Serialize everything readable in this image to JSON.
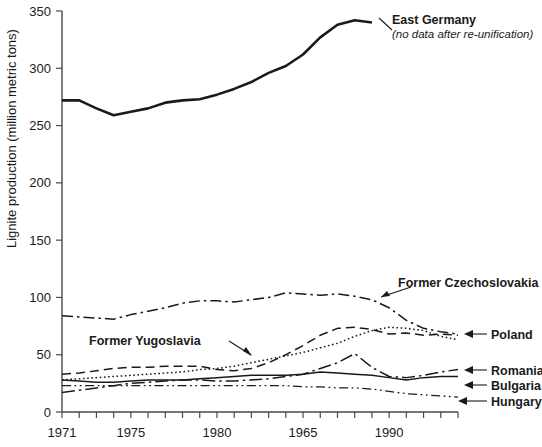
{
  "chart_data": {
    "type": "line",
    "title": "",
    "xlabel": "",
    "ylabel": "Lignite production (million metric tons)",
    "xlim": [
      1971,
      1994
    ],
    "ylim": [
      0,
      350
    ],
    "grid": false,
    "legend_position": "inline-annotations",
    "y_ticks": [
      0,
      50,
      100,
      150,
      200,
      250,
      300,
      350
    ],
    "y_tick_labels": [
      "0",
      "50",
      "100",
      "150",
      "200",
      "250",
      "300",
      "350"
    ],
    "x_tick_values": [
      1971,
      1972,
      1973,
      1974,
      1975,
      1976,
      1977,
      1978,
      1979,
      1980,
      1981,
      1982,
      1983,
      1984,
      1985,
      1986,
      1987,
      1988,
      1989,
      1990,
      1991,
      1992,
      1993,
      1994
    ],
    "x_tick_labels": [
      {
        "value": 1971,
        "label": "1971"
      },
      {
        "value": 1975,
        "label": "1975"
      },
      {
        "value": 1980,
        "label": "1980"
      },
      {
        "value": 1985,
        "label": "1965"
      },
      {
        "value": 1990,
        "label": "1990"
      }
    ],
    "series": [
      {
        "name": "East Germany",
        "style": "solid",
        "note": "(no data after re-unification)",
        "x": [
          1971,
          1972,
          1973,
          1974,
          1975,
          1976,
          1977,
          1978,
          1979,
          1980,
          1981,
          1982,
          1983,
          1984,
          1985,
          1986,
          1987,
          1988,
          1989
        ],
        "values": [
          272,
          272,
          265,
          259,
          262,
          265,
          270,
          272,
          273,
          277,
          282,
          288,
          296,
          302,
          312,
          327,
          338,
          342,
          340
        ]
      },
      {
        "name": "Former Czechoslovakia",
        "style": "dash-dot",
        "x": [
          1971,
          1972,
          1973,
          1974,
          1975,
          1976,
          1977,
          1978,
          1979,
          1980,
          1981,
          1982,
          1983,
          1984,
          1985,
          1986,
          1987,
          1988,
          1989,
          1990,
          1991,
          1992,
          1993,
          1994
        ],
        "values": [
          84,
          83,
          82,
          81,
          85,
          88,
          91,
          95,
          97,
          97,
          96,
          98,
          100,
          104,
          103,
          102,
          103,
          101,
          98,
          91,
          80,
          73,
          70,
          68
        ]
      },
      {
        "name": "Poland",
        "style": "dashed",
        "x": [
          1971,
          1972,
          1973,
          1974,
          1975,
          1976,
          1977,
          1978,
          1979,
          1980,
          1981,
          1982,
          1983,
          1984,
          1985,
          1986,
          1987,
          1988,
          1989,
          1990,
          1991,
          1992,
          1993,
          1994
        ],
        "values": [
          33,
          34,
          36,
          38,
          39,
          39,
          40,
          40,
          40,
          37,
          36,
          38,
          43,
          50,
          58,
          67,
          73,
          74,
          72,
          68,
          69,
          67,
          68,
          67
        ]
      },
      {
        "name": "Former Yugoslavia",
        "style": "dotted",
        "x": [
          1971,
          1972,
          1973,
          1974,
          1975,
          1976,
          1977,
          1978,
          1979,
          1980,
          1981,
          1982,
          1983,
          1984,
          1985,
          1986,
          1987,
          1988,
          1989,
          1990,
          1991,
          1992,
          1993,
          1994
        ],
        "values": [
          28,
          29,
          30,
          31,
          32,
          33,
          34,
          35,
          37,
          38,
          40,
          43,
          46,
          49,
          52,
          56,
          60,
          66,
          71,
          74,
          73,
          71,
          66,
          63
        ]
      },
      {
        "name": "Romania",
        "style": "long-dash-dot",
        "x": [
          1971,
          1972,
          1973,
          1974,
          1975,
          1976,
          1977,
          1978,
          1979,
          1980,
          1981,
          1982,
          1983,
          1984,
          1985,
          1986,
          1987,
          1988,
          1989,
          1990,
          1991,
          1992,
          1993,
          1994
        ],
        "values": [
          17,
          19,
          21,
          23,
          25,
          26,
          27,
          28,
          28,
          27,
          27,
          28,
          29,
          31,
          33,
          38,
          43,
          51,
          39,
          31,
          30,
          32,
          35,
          37
        ]
      },
      {
        "name": "Bulgaria",
        "style": "solid-thin",
        "x": [
          1971,
          1972,
          1973,
          1974,
          1975,
          1976,
          1977,
          1978,
          1979,
          1980,
          1981,
          1982,
          1983,
          1984,
          1985,
          1986,
          1987,
          1988,
          1989,
          1990,
          1991,
          1992,
          1993,
          1994
        ],
        "values": [
          28,
          27,
          26,
          26,
          27,
          28,
          28,
          28,
          29,
          30,
          31,
          32,
          32,
          32,
          33,
          35,
          34,
          33,
          32,
          30,
          28,
          30,
          31,
          31
        ]
      },
      {
        "name": "Hungary",
        "style": "dash-dot-dot",
        "x": [
          1971,
          1972,
          1973,
          1974,
          1975,
          1976,
          1977,
          1978,
          1979,
          1980,
          1981,
          1982,
          1983,
          1984,
          1985,
          1986,
          1987,
          1988,
          1989,
          1990,
          1991,
          1992,
          1993,
          1994
        ],
        "values": [
          23,
          23,
          23,
          23,
          23,
          23,
          23,
          23,
          23,
          23,
          23,
          23,
          23,
          23,
          22,
          22,
          21,
          21,
          20,
          18,
          16,
          15,
          14,
          13
        ]
      }
    ],
    "annotations": [
      {
        "name": "East Germany",
        "text": "East Germany",
        "subtext": "(no data after re-unification)"
      },
      {
        "name": "Former Czechoslovakia",
        "text": "Former Czechoslovakia"
      },
      {
        "name": "Former Yugoslavia",
        "text": "Former Yugoslavia"
      },
      {
        "name": "Poland",
        "text": "Poland"
      },
      {
        "name": "Romania",
        "text": "Romania"
      },
      {
        "name": "Bulgaria",
        "text": "Bulgaria"
      },
      {
        "name": "Hungary",
        "text": "Hungary"
      }
    ]
  }
}
